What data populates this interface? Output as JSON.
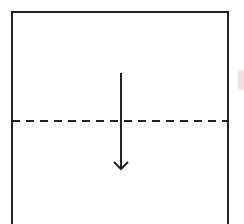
{
  "diagram": {
    "title": "Fold paper in half downward along dashed line",
    "type": "origami-fold-step",
    "paper": {
      "label": "paper-sheet",
      "border_color": "#222222",
      "fill": "#ffffff"
    },
    "fold_line": {
      "label": "valley-fold-line",
      "style": "dashed",
      "color": "#222222",
      "position": "horizontal middle"
    },
    "arrow": {
      "label": "fold-direction-arrow",
      "direction": "down",
      "color": "#222222"
    }
  }
}
